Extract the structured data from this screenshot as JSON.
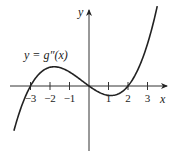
{
  "chart_data": {
    "type": "line",
    "title": "",
    "curve_label": "y = g″(x)",
    "xlabel": "x",
    "ylabel": "y",
    "x_ticks": [
      -3,
      -2,
      -1,
      1,
      2,
      3
    ],
    "x_tick_labels": [
      "−3",
      "−2",
      "−1",
      "1",
      "2",
      "3"
    ],
    "y_ticks": [],
    "grid": false,
    "legend": "none",
    "xlim": [
      -4.1,
      4.0
    ],
    "ylim": [
      -3.3,
      4.0
    ],
    "roots": [
      -3,
      0,
      2
    ],
    "local_max": {
      "x": -1.7,
      "y": 1.0
    },
    "local_min": {
      "x": 1.1,
      "y": -0.5
    },
    "series": [
      {
        "name": "g''(x)",
        "formula": "0.12*x*(x+3)*(x-2)",
        "x": [
          -3.85,
          -3.5,
          -3.0,
          -2.5,
          -2.0,
          -1.7,
          -1.0,
          -0.5,
          0.0,
          0.5,
          1.0,
          1.1,
          1.5,
          2.0,
          2.5,
          3.0,
          3.3,
          3.5
        ],
        "y": [
          -2.29,
          -0.95,
          0.0,
          0.68,
          0.96,
          1.0,
          0.72,
          0.38,
          0.0,
          -0.32,
          -0.48,
          -0.49,
          -0.41,
          0.0,
          0.83,
          2.16,
          3.25,
          4.1
        ]
      }
    ]
  }
}
